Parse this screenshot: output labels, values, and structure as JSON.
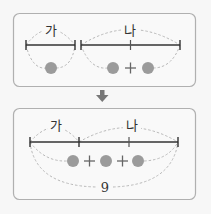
{
  "top_panel": {
    "segment_a_label": "가",
    "segment_b_label": "나",
    "segment_a_dots": 1,
    "segment_b_expression": [
      "●",
      "+",
      "●"
    ]
  },
  "arrow": {
    "icon": "arrow-down-icon"
  },
  "bottom_panel": {
    "segment_a_label": "가",
    "segment_b_label": "나",
    "expression": [
      "●",
      "+",
      "●",
      "+",
      "●"
    ],
    "total_label": "9"
  },
  "colors": {
    "dot": "#9b9b9b",
    "line": "#333333",
    "box_border": "#b0b0b0",
    "arc": "#b9b9b9"
  }
}
